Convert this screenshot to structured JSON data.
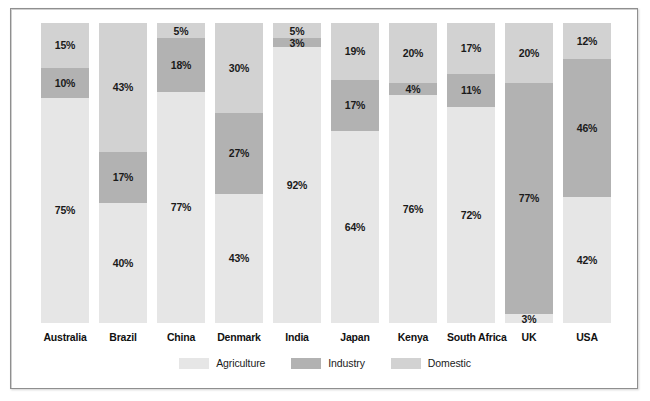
{
  "chart_data": {
    "type": "bar",
    "subtype": "stacked-100-percent",
    "title": "",
    "subtitle": "",
    "xlabel": "",
    "ylabel": "",
    "ylim": [
      0,
      100
    ],
    "grid": false,
    "legend_position": "bottom",
    "orientation": "vertical",
    "stack_order_top_to_bottom": [
      "Domestic",
      "Industry",
      "Agriculture"
    ],
    "categories": [
      "Australia",
      "Brazil",
      "China",
      "Denmark",
      "India",
      "Japan",
      "Kenya",
      "South Africa",
      "UK",
      "USA"
    ],
    "series": [
      {
        "name": "Agriculture",
        "color": "#e6e6e6",
        "values": [
          75,
          40,
          77,
          43,
          92,
          64,
          76,
          72,
          3,
          42
        ],
        "value_labels": [
          "75%",
          "40%",
          "77%",
          "43%",
          "92%",
          "64%",
          "76%",
          "72%",
          "3%",
          "42%"
        ]
      },
      {
        "name": "Industry",
        "color": "#b2b2b2",
        "values": [
          10,
          17,
          18,
          27,
          3,
          17,
          4,
          11,
          77,
          46
        ],
        "value_labels": [
          "10%",
          "17%",
          "18%",
          "27%",
          "3%",
          "17%",
          "4%",
          "11%",
          "77%",
          "46%"
        ]
      },
      {
        "name": "Domestic",
        "color": "#d2d2d2",
        "values": [
          15,
          43,
          5,
          30,
          5,
          19,
          20,
          17,
          20,
          12
        ],
        "value_labels": [
          "15%",
          "43%",
          "5%",
          "30%",
          "5%",
          "19%",
          "20%",
          "17%",
          "20%",
          "12%"
        ]
      }
    ],
    "legend": [
      {
        "label": "Agriculture",
        "color": "#e6e6e6"
      },
      {
        "label": "Industry",
        "color": "#b2b2b2"
      },
      {
        "label": "Domestic",
        "color": "#d2d2d2"
      }
    ]
  },
  "colors": {
    "agriculture": "#e6e6e6",
    "industry": "#b2b2b2",
    "domestic": "#d2d2d2",
    "frame_border": "#8f8f8f",
    "background": "#ffffff",
    "label_text": "#1a1a1a"
  }
}
